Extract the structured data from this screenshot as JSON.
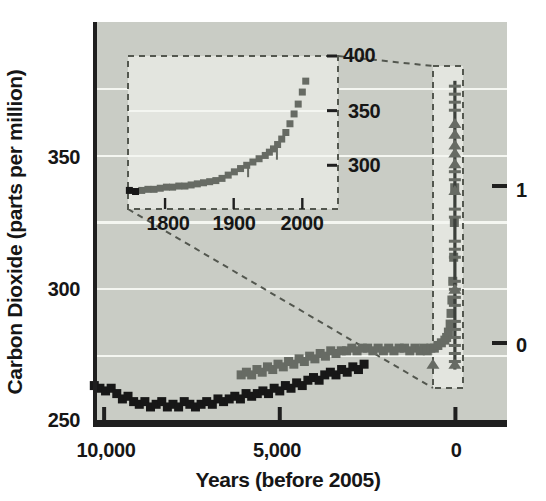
{
  "figure_title": "Carbon dioxide concentration over the last 10,000 years",
  "colors": {
    "page_bg": "#ffffff",
    "plot_bg": "#c9ccc5",
    "box_bg": "#e3e5df",
    "gridline": "#f4f6f1",
    "axis": "#1f1f1f",
    "text": "#161616",
    "dash_outline": "#53574f",
    "series_dark": "#171717",
    "series_gray": "#676b64",
    "spike_line": "#3c403b"
  },
  "chart_data": {
    "type": "scatter",
    "title": "",
    "xlabel": "Years (before 2005)",
    "ylabel": "Carbon Dioxide (parts per million)",
    "xlim": [
      10260,
      -1440
    ],
    "ylim": [
      250,
      400
    ],
    "grid": true,
    "x_axis": {
      "title": "Years (before 2005)",
      "ticks": [
        {
          "value": 10000,
          "label": "10,000"
        },
        {
          "value": 5000,
          "label": "5,000"
        },
        {
          "value": 0,
          "label": "0"
        }
      ]
    },
    "y_axis": {
      "title": "Carbon Dioxide (parts per million)",
      "ticks": [
        {
          "value": 350,
          "label": "350"
        },
        {
          "value": 300,
          "label": "300"
        },
        {
          "value": 250,
          "label": "250"
        }
      ],
      "gridlines_ppm": [
        375,
        350,
        325,
        300,
        275
      ]
    },
    "right_axis": {
      "ticks": [
        {
          "value": 1,
          "label": "1"
        },
        {
          "value": 0,
          "label": "0"
        }
      ]
    },
    "series": [
      {
        "name": "ice-core-dark",
        "marker": "square",
        "points": [
          [
            10280,
            264
          ],
          [
            10120,
            263
          ],
          [
            9960,
            262
          ],
          [
            9800,
            263
          ],
          [
            9640,
            261
          ],
          [
            9480,
            259
          ],
          [
            9320,
            260
          ],
          [
            9160,
            258
          ],
          [
            9000,
            257
          ],
          [
            8840,
            258
          ],
          [
            8680,
            256
          ],
          [
            8520,
            257
          ],
          [
            8360,
            258
          ],
          [
            8200,
            256
          ],
          [
            8040,
            257
          ],
          [
            7880,
            256
          ],
          [
            7720,
            258
          ],
          [
            7560,
            257
          ],
          [
            7400,
            256
          ],
          [
            7240,
            257
          ],
          [
            7080,
            258
          ],
          [
            6920,
            257
          ],
          [
            6760,
            259
          ],
          [
            6600,
            258
          ],
          [
            6440,
            259
          ],
          [
            6280,
            260
          ],
          [
            6120,
            259
          ],
          [
            5960,
            261
          ],
          [
            5800,
            260
          ],
          [
            5640,
            261
          ],
          [
            5480,
            262
          ],
          [
            5320,
            261
          ],
          [
            5160,
            263
          ],
          [
            5000,
            262
          ],
          [
            4840,
            264
          ],
          [
            4680,
            263
          ],
          [
            4520,
            265
          ],
          [
            4360,
            264
          ],
          [
            4200,
            266
          ],
          [
            4040,
            267
          ],
          [
            3880,
            266
          ],
          [
            3720,
            268
          ],
          [
            3560,
            269
          ],
          [
            3400,
            268
          ],
          [
            3240,
            270
          ],
          [
            3080,
            269
          ],
          [
            2920,
            271
          ],
          [
            2760,
            270
          ],
          [
            2600,
            272
          ]
        ]
      },
      {
        "name": "ice-core-gray",
        "marker": "square",
        "points": [
          [
            6100,
            268
          ],
          [
            5950,
            269
          ],
          [
            5800,
            268
          ],
          [
            5650,
            270
          ],
          [
            5500,
            269
          ],
          [
            5350,
            271
          ],
          [
            5200,
            270
          ],
          [
            5050,
            272
          ],
          [
            4900,
            271
          ],
          [
            4750,
            273
          ],
          [
            4600,
            272
          ],
          [
            4450,
            274
          ],
          [
            4300,
            273
          ],
          [
            4150,
            275
          ],
          [
            4000,
            274
          ],
          [
            3850,
            276
          ],
          [
            3700,
            275
          ],
          [
            3550,
            277
          ],
          [
            3400,
            276
          ],
          [
            3250,
            277
          ],
          [
            3100,
            277
          ],
          [
            2950,
            278
          ],
          [
            2800,
            277
          ],
          [
            2650,
            278
          ],
          [
            2500,
            278
          ],
          [
            2350,
            277
          ],
          [
            2200,
            278
          ],
          [
            2050,
            277
          ],
          [
            1900,
            278
          ],
          [
            1750,
            277
          ],
          [
            1600,
            278
          ],
          [
            1450,
            278
          ],
          [
            1300,
            277
          ],
          [
            1150,
            278
          ],
          [
            1000,
            277
          ],
          [
            900,
            278
          ],
          [
            800,
            277
          ],
          [
            700,
            278
          ],
          [
            600,
            278
          ],
          [
            500,
            279
          ],
          [
            400,
            280
          ],
          [
            300,
            281
          ],
          [
            250,
            282
          ],
          [
            200,
            284
          ],
          [
            150,
            287
          ],
          [
            125,
            291
          ],
          [
            100,
            296
          ],
          [
            75,
            303
          ],
          [
            50,
            312
          ],
          [
            30,
            325
          ],
          [
            20,
            338
          ]
        ]
      }
    ],
    "spike": {
      "x_year": 15,
      "line_ppm": [
        270,
        378
      ],
      "dash_markers_ppm": [
        376,
        373,
        370,
        367,
        344,
        341,
        330,
        327,
        318,
        315,
        312,
        303,
        300,
        297,
        294,
        288,
        285,
        282,
        279,
        276,
        273
      ],
      "triangle_markers_ppm": [
        362,
        358,
        354,
        351,
        347,
        337,
        300,
        272
      ]
    },
    "outlier_triangle": {
      "year": 640,
      "ppm": 272
    },
    "inset": {
      "xlim": [
        1746,
        2052
      ],
      "ylim": [
        260,
        400
      ],
      "x_axis": {
        "ticks": [
          {
            "value": 1800,
            "label": "1800"
          },
          {
            "value": 1900,
            "label": "1900"
          },
          {
            "value": 2000,
            "label": "2000"
          }
        ]
      },
      "y_axis": {
        "ticks": [
          {
            "value": 400,
            "label": "400"
          },
          {
            "value": 350,
            "label": "350"
          },
          {
            "value": 300,
            "label": "300"
          }
        ]
      },
      "series": [
        {
          "name": "inset-dark",
          "marker": "square",
          "points": [
            [
              1748,
              277
            ],
            [
              1757,
              276
            ]
          ]
        },
        {
          "name": "inset-gray",
          "marker": "square",
          "points": [
            [
              1766,
              277
            ],
            [
              1775,
              278
            ],
            [
              1784,
              278
            ],
            [
              1793,
              279
            ],
            [
              1802,
              280
            ],
            [
              1811,
              280
            ],
            [
              1820,
              281
            ],
            [
              1829,
              281
            ],
            [
              1838,
              282
            ],
            [
              1847,
              283
            ],
            [
              1856,
              284
            ],
            [
              1865,
              285
            ],
            [
              1874,
              286
            ],
            [
              1883,
              288
            ],
            [
              1892,
              291
            ],
            [
              1901,
              294
            ],
            [
              1910,
              297
            ],
            [
              1919,
              300
            ],
            [
              1928,
              303
            ],
            [
              1937,
              306
            ],
            [
              1946,
              309
            ],
            [
              1952,
              312
            ],
            [
              1958,
              315
            ],
            [
              1964,
              319
            ],
            [
              1970,
              324
            ],
            [
              1976,
              330
            ],
            [
              1982,
              338
            ],
            [
              1988,
              347
            ],
            [
              1994,
              356
            ],
            [
              2000,
              367
            ],
            [
              2005,
              377
            ]
          ]
        }
      ],
      "error_bars": [
        [
          1921,
          301
        ],
        [
          1963,
          317
        ]
      ]
    }
  }
}
